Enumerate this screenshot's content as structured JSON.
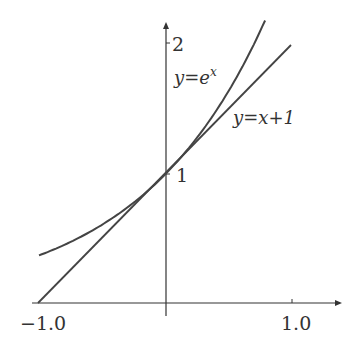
{
  "chart_data": {
    "type": "line",
    "title": "",
    "xlabel": "",
    "ylabel": "",
    "xlim": [
      -1.0,
      1.0
    ],
    "ylim": [
      0,
      2
    ],
    "grid": false,
    "x_ticks": [
      "-1.0",
      "1.0"
    ],
    "y_ticks": [
      "1",
      "2"
    ],
    "series": [
      {
        "name": "y=e^x",
        "function": "exp(x)",
        "x_range": [
          -1.0,
          0.78
        ]
      },
      {
        "name": "y=x+1",
        "function": "x+1",
        "x_range": [
          -1.0,
          1.0
        ]
      }
    ],
    "annotations": [
      {
        "text": "y=e",
        "superscript": "x",
        "near": "upper curve"
      },
      {
        "text": "y=x+1",
        "near": "tangent line"
      }
    ]
  },
  "labels": {
    "x_tick_neg": "−1.0",
    "x_tick_pos": "1.0",
    "y_tick_1": "1",
    "y_tick_2": "2",
    "exp_label_main": "y=e",
    "exp_label_sup": "x",
    "line_label": "y=x+1"
  }
}
